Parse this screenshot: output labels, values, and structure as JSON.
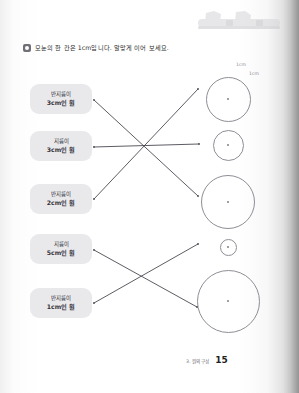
{
  "page": {
    "number": "15",
    "chapter_label": "3. 원의 구성",
    "background_color": "#ffffff",
    "paper_edge_color": "#c9c9c9"
  },
  "header": {
    "ornament_name": "decorative-shapes-banner",
    "ornament_color": "#d3d3d6"
  },
  "instruction": {
    "badge": "filled-square-bullet",
    "text": "모눈의 한 칸은 1cm입니다. 알맞게 이어 보세요."
  },
  "scale_notes": [
    {
      "label": "1cm",
      "x": 236,
      "y": 62
    },
    {
      "label": "1cm",
      "x": 249,
      "y": 71
    }
  ],
  "labels": [
    {
      "id": "label-radius-3",
      "line1": "반지름이",
      "line2": "3cm인 원",
      "x": 30,
      "y": 84
    },
    {
      "id": "label-diameter-3",
      "line1": "지름이",
      "line2": "3cm인 원",
      "x": 30,
      "y": 131
    },
    {
      "id": "label-radius-2",
      "line1": "반지름이",
      "line2": "2cm인 원",
      "x": 30,
      "y": 184
    },
    {
      "id": "label-diameter-5",
      "line1": "지름이",
      "line2": "5cm인 원",
      "x": 30,
      "y": 234
    },
    {
      "id": "label-radius-1",
      "line1": "반지름이",
      "line2": "1cm인 원",
      "x": 30,
      "y": 288
    }
  ],
  "circles": [
    {
      "id": "circle-a",
      "cx": 228,
      "cy": 99,
      "d": 45,
      "measure": "지름 3cm"
    },
    {
      "id": "circle-b",
      "cx": 228,
      "cy": 145,
      "d": 31,
      "measure": "지름 2cm"
    },
    {
      "id": "circle-c",
      "cx": 228,
      "cy": 202,
      "d": 54,
      "measure": "지름 4cm"
    },
    {
      "id": "circle-d",
      "cx": 228,
      "cy": 247,
      "d": 17,
      "measure": "지름 1cm"
    },
    {
      "id": "circle-e",
      "cx": 228,
      "cy": 301,
      "d": 63,
      "measure": "지름 5cm"
    }
  ],
  "connectors": [
    {
      "id": "link-1",
      "from": "label-radius-3",
      "to": "circle-c",
      "x1": 94,
      "y1": 100,
      "x2": 198,
      "y2": 196
    },
    {
      "id": "link-2",
      "from": "label-diameter-3",
      "to": "circle-b",
      "x1": 94,
      "y1": 147,
      "x2": 199,
      "y2": 144
    },
    {
      "id": "link-3",
      "from": "label-radius-2",
      "to": "circle-a",
      "x1": 94,
      "y1": 199,
      "x2": 198,
      "y2": 89
    },
    {
      "id": "link-4",
      "from": "label-diameter-5",
      "to": "circle-e",
      "x1": 94,
      "y1": 250,
      "x2": 197,
      "y2": 307
    },
    {
      "id": "link-5",
      "from": "label-radius-1",
      "to": "circle-d",
      "x1": 94,
      "y1": 303,
      "x2": 198,
      "y2": 244
    }
  ],
  "colors": {
    "label_fill": "#e9e9ec",
    "label_text": "#32323a",
    "circle_stroke": "#8e8e96",
    "connector_stroke": "#4a4a52"
  }
}
